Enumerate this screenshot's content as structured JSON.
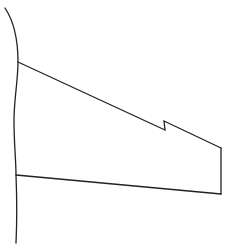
{
  "diagram": {
    "type": "line-drawing",
    "stroke_color": "#222222",
    "background_color": "#ffffff",
    "shapes": {
      "left_curve": {
        "points": [
          [
            5,
            8
          ],
          [
            14,
            28
          ],
          [
            18,
            62
          ],
          [
            14,
            110
          ],
          [
            15,
            175
          ],
          [
            17,
            243
          ]
        ]
      },
      "panel_outline": {
        "points": [
          [
            18,
            62
          ],
          [
            165,
            130
          ],
          [
            164,
            121
          ],
          [
            221,
            148
          ],
          [
            221,
            194
          ],
          [
            16,
            175
          ]
        ],
        "features": [
          "notch-step on top edge",
          "vertical right edge",
          "straight bottom edge"
        ]
      }
    }
  }
}
